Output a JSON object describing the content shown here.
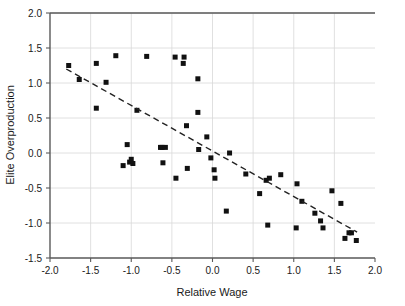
{
  "chart_data": {
    "type": "scatter",
    "title": "",
    "xlabel": "Relative Wage",
    "ylabel": "Elite Overproduction",
    "xlim": [
      -2.0,
      2.0
    ],
    "ylim": [
      -1.5,
      2.0
    ],
    "xticks": [
      -2.0,
      -1.5,
      -1.0,
      -0.5,
      0.0,
      0.5,
      1.0,
      1.5,
      2.0
    ],
    "yticks": [
      -1.5,
      -1.0,
      -0.5,
      0.0,
      0.5,
      1.0,
      1.5,
      2.0
    ],
    "xtick_labels": [
      "-2.0",
      "-1.5",
      "-1.0",
      "-0.5",
      "0.0",
      "0.5",
      "1.0",
      "1.5",
      "2.0"
    ],
    "ytick_labels": [
      "-1.5",
      "-1.0",
      "-0.5",
      "0.0",
      "0.5",
      "1.0",
      "1.5",
      "2.0"
    ],
    "grid": true,
    "grid_color": "#d8d8d8",
    "legend": false,
    "marker_style": "square",
    "marker_color": "#111111",
    "marker_size": 5,
    "points": [
      [
        -1.77,
        1.25
      ],
      [
        -1.64,
        1.05
      ],
      [
        -1.43,
        1.28
      ],
      [
        -1.43,
        0.64
      ],
      [
        -1.31,
        1.01
      ],
      [
        -1.19,
        1.39
      ],
      [
        -1.1,
        -0.18
      ],
      [
        -1.05,
        0.12
      ],
      [
        -1.02,
        -0.13
      ],
      [
        -1.0,
        -0.09
      ],
      [
        -0.98,
        -0.15
      ],
      [
        -0.93,
        0.61
      ],
      [
        -0.81,
        1.38
      ],
      [
        -0.64,
        0.08
      ],
      [
        -0.62,
        0.08
      ],
      [
        -0.61,
        -0.14
      ],
      [
        -0.58,
        0.08
      ],
      [
        -0.46,
        1.37
      ],
      [
        -0.45,
        -0.36
      ],
      [
        -0.35,
        1.37
      ],
      [
        -0.36,
        1.28
      ],
      [
        -0.32,
        0.39
      ],
      [
        -0.31,
        -0.22
      ],
      [
        -0.18,
        1.06
      ],
      [
        -0.18,
        0.58
      ],
      [
        -0.17,
        0.05
      ],
      [
        -0.07,
        0.23
      ],
      [
        -0.02,
        -0.07
      ],
      [
        0.02,
        -0.24
      ],
      [
        0.03,
        -0.36
      ],
      [
        0.17,
        -0.83
      ],
      [
        0.21,
        0.0
      ],
      [
        0.41,
        -0.3
      ],
      [
        0.58,
        -0.58
      ],
      [
        0.66,
        -0.39
      ],
      [
        0.68,
        -1.03
      ],
      [
        0.7,
        -0.36
      ],
      [
        0.84,
        -0.31
      ],
      [
        1.03,
        -1.07
      ],
      [
        1.04,
        -0.44
      ],
      [
        1.1,
        -0.69
      ],
      [
        1.26,
        -0.86
      ],
      [
        1.33,
        -0.97
      ],
      [
        1.36,
        -1.07
      ],
      [
        1.47,
        -0.54
      ],
      [
        1.58,
        -0.72
      ],
      [
        1.63,
        -1.22
      ],
      [
        1.68,
        -1.14
      ],
      [
        1.71,
        -1.14
      ],
      [
        1.77,
        -1.25
      ]
    ],
    "trendline": {
      "style": "dashed",
      "color": "#222222",
      "x_start": -1.8,
      "y_start": 1.2,
      "x_end": 1.78,
      "y_end": -1.13
    }
  }
}
